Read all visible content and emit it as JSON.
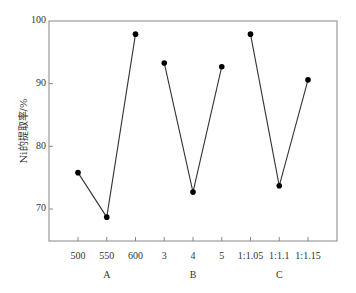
{
  "chart_data": {
    "type": "line",
    "title": "",
    "xlabel": "",
    "ylabel": "Ni的提取率/%",
    "ylim": [
      65,
      100
    ],
    "yticks": [
      70,
      80,
      90,
      100
    ],
    "grid": false,
    "legend": "none",
    "series": [
      {
        "name": "A",
        "group_label": "A",
        "categories": [
          "500",
          "550",
          "600"
        ],
        "values": [
          75.8,
          68.7,
          97.9
        ]
      },
      {
        "name": "B",
        "group_label": "B",
        "categories": [
          "3",
          "4",
          "5"
        ],
        "values": [
          93.3,
          72.7,
          92.7
        ]
      },
      {
        "name": "C",
        "group_label": "C",
        "categories": [
          "1:1.05",
          "1:1.1",
          "1:1.15"
        ],
        "values": [
          97.9,
          73.7,
          90.6
        ]
      }
    ],
    "colors": {
      "line": "#333333",
      "marker": "#000000",
      "axis": "#888888"
    }
  }
}
